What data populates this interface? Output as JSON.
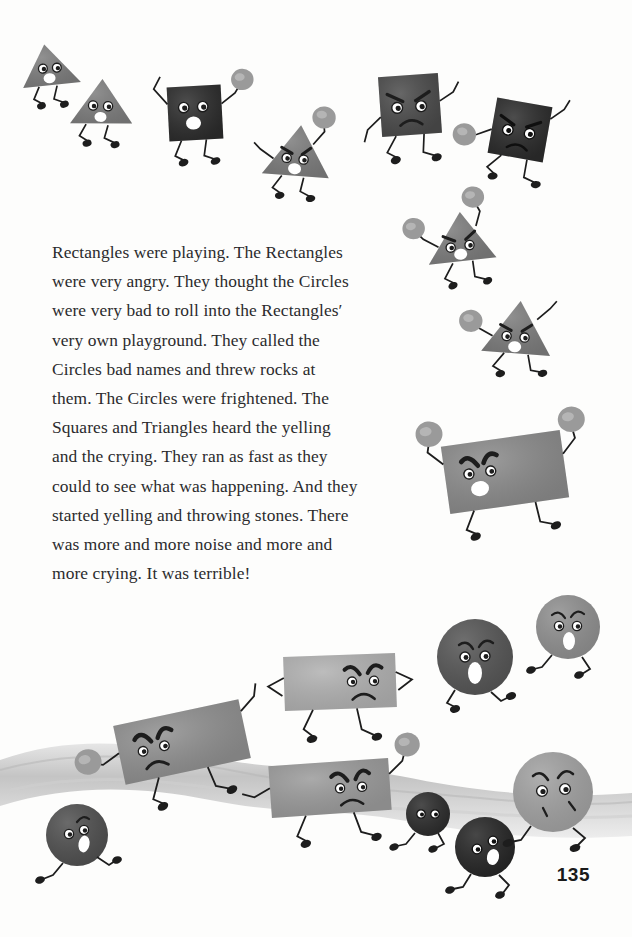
{
  "page": {
    "number": "135",
    "background_color": "#fdfdfc",
    "text_color": "#2b2b2d"
  },
  "story": {
    "paragraph": "Rectangles were playing. The Rectangles were very angry. They thought the Circles were very bad to roll into the Rectangles′ very own playground. They called the Circles bad names and threw rocks at them. The Circles were frightened. The Squares and Triangles heard the yelling and the crying. They ran as fast as they could to see what was happening. And they started yelling and throwing stones. There was more and more noise and more and more crying. It was terrible!",
    "lines": [
      "Rectangles were playing. The",
      "Rectangles were very angry. They",
      "thought the Circles were very bad to",
      "roll into the Rectangles′ very own",
      "playground. They called the Circles",
      "bad names and threw rocks at them.",
      "The Circles were frightened. The",
      "Squares and Triangles heard the",
      "yelling and the crying. They ran as",
      "fast as they could to see what was",
      "happening. And they started yelling",
      "and throwing stones. There was",
      "more and more noise and more and",
      "more crying. It was terrible!"
    ]
  },
  "illustration": {
    "description": "Cartoon geometric shape characters with stick arms and legs throwing rocks at each other above a wavy gray ground band",
    "ground": {
      "color": "#c9c9c9",
      "label": "ground-band"
    },
    "palette": {
      "triangle_gray": "#7c7c7c",
      "square_dark": "#2e2e2e",
      "rectangle_gray": "#8a8a8a",
      "rectangle_light": "#b3b3b3",
      "circle_dark": "#3a3a3a",
      "circle_mid": "#6e6e6e",
      "circle_light": "#a6a6a6",
      "rock_gray": "#9a9a9a",
      "limb_black": "#1d1d1d",
      "mouth_white": "#ffffff"
    },
    "characters": [
      {
        "name": "triangle-1",
        "shape": "triangle",
        "mood": "neutral",
        "fill": "#7c7c7c",
        "cx": 52,
        "cy": 68,
        "size": 44,
        "rot": -4,
        "mouth": "oval",
        "brows": false,
        "rocks": 0
      },
      {
        "name": "triangle-2",
        "shape": "triangle",
        "mood": "neutral",
        "fill": "#7c7c7c",
        "cx": 103,
        "cy": 105,
        "size": 46,
        "rot": 3,
        "mouth": "oval",
        "brows": false,
        "rocks": 0
      },
      {
        "name": "square-1",
        "shape": "square",
        "mood": "neutral",
        "fill": "#2b2b2b",
        "cx": 195,
        "cy": 113,
        "size": 50,
        "rot": -3,
        "mouth": "oval",
        "brows": false,
        "rocks": 1
      },
      {
        "name": "triangle-3",
        "shape": "triangle",
        "mood": "angry",
        "fill": "#7c7c7c",
        "cx": 298,
        "cy": 155,
        "size": 52,
        "rot": 6,
        "mouth": "oval",
        "brows": true,
        "rocks": 1
      },
      {
        "name": "square-2",
        "shape": "square",
        "mood": "angry",
        "fill": "#4a4a4a",
        "cx": 410,
        "cy": 105,
        "size": 54,
        "rot": -4,
        "mouth": "frown",
        "brows": true,
        "rocks": 0
      },
      {
        "name": "square-3",
        "shape": "square",
        "mood": "angry",
        "fill": "#2b2b2b",
        "cx": 520,
        "cy": 130,
        "size": 52,
        "rot": 10,
        "mouth": "frown",
        "brows": true,
        "rocks": 1
      },
      {
        "name": "triangle-4",
        "shape": "triangle",
        "mood": "angry",
        "fill": "#7c7c7c",
        "cx": 462,
        "cy": 240,
        "size": 50,
        "rot": -8,
        "mouth": "oval",
        "brows": true,
        "rocks": 2
      },
      {
        "name": "triangle-5",
        "shape": "triangle",
        "mood": "angry",
        "fill": "#7c7c7c",
        "cx": 518,
        "cy": 330,
        "size": 52,
        "rot": 5,
        "mouth": "oval",
        "brows": true,
        "rocks": 1
      },
      {
        "name": "rectangle-1",
        "shape": "rectangle",
        "mood": "angry",
        "fill": "#8a8a8a",
        "cx": 505,
        "cy": 470,
        "w": 118,
        "h": 68,
        "rot": -8,
        "mouth": "oval",
        "brows": true,
        "rocks": 2
      },
      {
        "name": "rectangle-2",
        "shape": "rectangle",
        "mood": "angry",
        "fill": "#b0b0b0",
        "cx": 340,
        "cy": 680,
        "w": 110,
        "h": 52,
        "rot": -2,
        "mouth": "frown",
        "brows": true,
        "rocks": 0
      },
      {
        "name": "rectangle-3",
        "shape": "rectangle",
        "mood": "angry",
        "fill": "#8f8f8f",
        "cx": 180,
        "cy": 740,
        "w": 128,
        "h": 60,
        "rot": -12,
        "mouth": "frown",
        "brows": true,
        "rocks": 1
      },
      {
        "name": "rectangle-4",
        "shape": "rectangle",
        "mood": "angry",
        "fill": "#9a9a9a",
        "cx": 330,
        "cy": 785,
        "w": 118,
        "h": 52,
        "rot": -4,
        "mouth": "frown",
        "brows": true,
        "rocks": 1
      },
      {
        "name": "circle-1",
        "shape": "circle",
        "mood": "scared",
        "fill": "#545454",
        "cx": 475,
        "cy": 655,
        "r": 38,
        "mouth": "oval",
        "brows": true
      },
      {
        "name": "circle-2",
        "shape": "circle",
        "mood": "scared",
        "fill": "#8e8e8e",
        "cx": 568,
        "cy": 627,
        "r": 32,
        "mouth": "oval",
        "brows": true
      },
      {
        "name": "circle-3",
        "shape": "circle",
        "mood": "scared",
        "fill": "#a0a0a0",
        "cx": 553,
        "cy": 790,
        "r": 40,
        "mouth": "oval",
        "brows": true
      },
      {
        "name": "circle-4",
        "shape": "circle",
        "mood": "scared",
        "fill": "#2a2a2a",
        "cx": 428,
        "cy": 812,
        "r": 22,
        "mouth": "none",
        "brows": false
      },
      {
        "name": "circle-5",
        "shape": "circle",
        "mood": "scared",
        "fill": "#242424",
        "cx": 485,
        "cy": 845,
        "r": 30,
        "mouth": "oval",
        "brows": false
      },
      {
        "name": "circle-6",
        "shape": "circle",
        "mood": "scared",
        "fill": "#4e4e4e",
        "cx": 77,
        "cy": 833,
        "r": 31,
        "mouth": "oval",
        "brows": true
      }
    ]
  }
}
